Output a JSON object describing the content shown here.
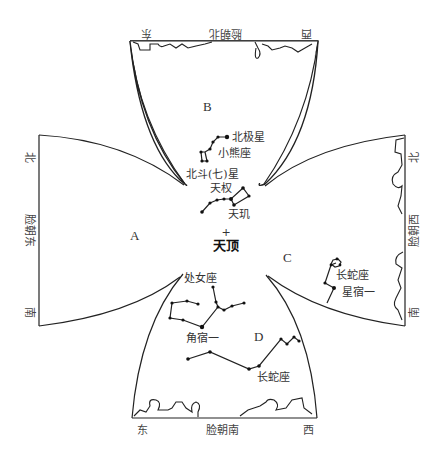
{
  "panels": {
    "A": {
      "letter": "A",
      "edge": {
        "north": "北",
        "face": "脸朝东",
        "south": "南"
      }
    },
    "B": {
      "letter": "B",
      "edge": {
        "east": "东",
        "face": "脸朝北",
        "west": "西"
      }
    },
    "C": {
      "letter": "C",
      "edge": {
        "north": "北",
        "face": "脸朝西",
        "south": "南"
      }
    },
    "D": {
      "letter": "D",
      "edge": {
        "east": "东",
        "face": "脸朝南",
        "west": "西"
      }
    }
  },
  "zenith": {
    "marker": "+",
    "label": "天顶"
  },
  "stars": {
    "polaris": "北极星",
    "ursa_minor": "小熊座",
    "big_dipper": "北斗(七)星",
    "tianquan": "天权",
    "tianji": "天玑",
    "virgo": "处女座",
    "spica": "角宿一",
    "hydra_south": "长蛇座",
    "hydra_west": "长蛇座",
    "alphard": "星宿一"
  }
}
